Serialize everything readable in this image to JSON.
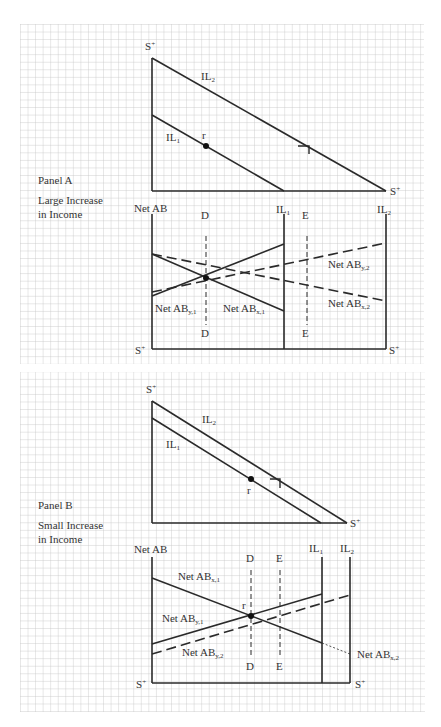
{
  "panels": [
    {
      "id": "A",
      "title": "Panel A",
      "subtitle_line1": "Large Increase",
      "subtitle_line2": "in Income",
      "top_graph": {
        "y_axis_label": "S",
        "y_axis_sup": "+",
        "y_axis_sub": "Y",
        "x_axis_label": "S",
        "x_axis_sup": "+",
        "x_axis_sub": "x",
        "lines": [
          {
            "name": "IL",
            "sub": "2"
          },
          {
            "name": "IL",
            "sub": "1"
          }
        ],
        "point_label": "r"
      },
      "bottom_graph": {
        "y_axis_label": "Net AB",
        "left_bottom_label": "S",
        "left_bottom_sup": "+",
        "left_bottom_sub": "Y",
        "right_bottom_label": "S",
        "right_bottom_sup": "+",
        "right_bottom_sub": "x",
        "verticals": [
          {
            "name": "IL",
            "sub": "1"
          },
          {
            "name": "IL",
            "sub": "2"
          }
        ],
        "dashed_markers": [
          "D",
          "E"
        ],
        "curves": [
          {
            "name": "Net AB",
            "sub": "y,1",
            "style": "solid"
          },
          {
            "name": "Net AB",
            "sub": "x,1",
            "style": "solid"
          },
          {
            "name": "Net AB",
            "sub": "y,2",
            "style": "dashed"
          },
          {
            "name": "Net AB",
            "sub": "x,2",
            "style": "dashed"
          }
        ]
      }
    },
    {
      "id": "B",
      "title": "Panel B",
      "subtitle_line1": "Small Increase",
      "subtitle_line2": "in Income",
      "top_graph": {
        "y_axis_label": "S",
        "y_axis_sup": "+",
        "y_axis_sub": "Y",
        "x_axis_label": "S",
        "x_axis_sup": "+",
        "x_axis_sub": "x",
        "lines": [
          {
            "name": "IL",
            "sub": "2"
          },
          {
            "name": "IL",
            "sub": "1"
          }
        ],
        "point_label": "r"
      },
      "bottom_graph": {
        "y_axis_label": "Net AB",
        "left_bottom_label": "S",
        "left_bottom_sup": "+",
        "left_bottom_sub": "Y",
        "right_bottom_label": "S",
        "right_bottom_sup": "+",
        "right_bottom_sub": "x",
        "verticals": [
          {
            "name": "IL",
            "sub": "1"
          },
          {
            "name": "IL",
            "sub": "2"
          }
        ],
        "dashed_markers": [
          "D",
          "E"
        ],
        "point_label": "r",
        "curves": [
          {
            "name": "Net AB",
            "sub": "x,1",
            "style": "solid"
          },
          {
            "name": "Net AB",
            "sub": "y,1",
            "style": "solid"
          },
          {
            "name": "Net AB",
            "sub": "y,2",
            "style": "dashed"
          },
          {
            "name": "Net AB",
            "sub": "x,2",
            "style": "dotted"
          }
        ]
      }
    }
  ],
  "colors": {
    "grid": "#bdbdbd",
    "ink": "#2a2a2a",
    "background": "#ffffff"
  }
}
